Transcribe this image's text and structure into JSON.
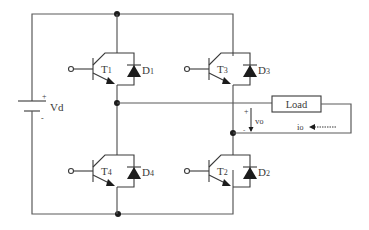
{
  "diagram": {
    "type": "full-bridge (H-bridge) inverter circuit",
    "source": {
      "label": "Vd",
      "plus": "+",
      "minus": "-"
    },
    "switches": [
      {
        "id": "T1",
        "label": "T",
        "sub": "1",
        "diode": "D",
        "diode_sub": "1",
        "position": "upper-left"
      },
      {
        "id": "T3",
        "label": "T",
        "sub": "3",
        "diode": "D",
        "diode_sub": "3",
        "position": "upper-right"
      },
      {
        "id": "T4",
        "label": "T",
        "sub": "4",
        "diode": "D",
        "diode_sub": "4",
        "position": "lower-left"
      },
      {
        "id": "T2",
        "label": "T",
        "sub": "2",
        "diode": "D",
        "diode_sub": "2",
        "position": "lower-right"
      }
    ],
    "load": {
      "label": "Load"
    },
    "output_voltage": {
      "label": "v",
      "sub": "o",
      "plus": "+",
      "minus": "-"
    },
    "output_current": {
      "label": "i",
      "sub": "o"
    },
    "colors": {
      "wire": "#5a5a5a",
      "device": "#3a3a3a",
      "fill": "#1c1c1c",
      "background": "#ffffff"
    }
  }
}
